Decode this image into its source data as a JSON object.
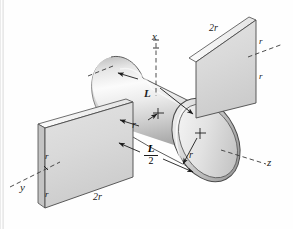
{
  "figure": {
    "kind": "engineering-solid-diagram",
    "background_color": "#fefefe",
    "line_color": "#1c1c1c",
    "surface_light": "#f2f2f2",
    "surface_mid": "#d8d8d8",
    "surface_dark": "#9a9a9a"
  },
  "axes": {
    "x_label": "x",
    "y_label": "y",
    "z_label": "z"
  },
  "dimensions": {
    "length_label": "L",
    "half_length_numerator": "L",
    "half_length_denominator": "2",
    "radius_label_axis": "r",
    "radius_label_face": "r",
    "plate_top_width": "2r",
    "plate_bottom_width": "2r",
    "plate_right_upper_half": "r",
    "plate_right_lower_half": "r",
    "plate_left_upper_half": "r",
    "plate_left_lower_half": "r"
  }
}
